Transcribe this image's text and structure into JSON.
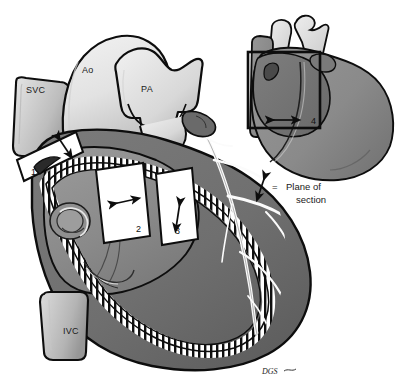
{
  "figure": {
    "background_color": "#ffffff",
    "outline_color": "#0d0d0d"
  },
  "palette": {
    "great_vessel_light": "#e8e8e8",
    "great_vessel_mid": "#c9c9c9",
    "vessel_shadow": "#9a9a9a",
    "myocardium": "#6f6f6f",
    "myocardium_dark": "#5a5a5a",
    "chamber_interior": "#8a8a8a",
    "chamber_interior_light": "#989898",
    "inset_body": "#8c8c8c",
    "inset_dark": "#6e6e6e",
    "trabecula_white": "#ffffff",
    "coronary_white": "#fbfbfb",
    "section_box_fill": "#ffffff",
    "line_black": "#0d0d0d"
  },
  "anatomy_labels": [
    {
      "id": "svc",
      "text": "SVC",
      "x": 26,
      "y": 93,
      "description": "superior vena cava"
    },
    {
      "id": "ao",
      "text": "Ao",
      "x": 82,
      "y": 73,
      "description": "aorta"
    },
    {
      "id": "pa",
      "text": "PA",
      "x": 141,
      "y": 92,
      "description": "pulmonary artery"
    },
    {
      "id": "ivc",
      "text": "IVC",
      "x": 63,
      "y": 334,
      "description": "inferior vena cava"
    }
  ],
  "section_boxes": [
    {
      "id": "box-1",
      "number": "1",
      "num_x": 31,
      "num_y": 175,
      "arrow": "diagonal",
      "has_crescent": true
    },
    {
      "id": "box-2",
      "number": "2",
      "num_x": 136,
      "num_y": 232,
      "arrow": "diagonal",
      "has_crescent": false
    },
    {
      "id": "box-3",
      "number": "3",
      "num_x": 175,
      "num_y": 234,
      "arrow": "vertical",
      "has_crescent": false
    },
    {
      "id": "box-4",
      "number": "4",
      "num_x": 311,
      "num_y": 124,
      "arrow": "horizontal",
      "has_crescent": false
    }
  ],
  "legend": {
    "symbol": "double-headed-arrow",
    "equals": "=",
    "line1": "Plane of",
    "line2": "section",
    "x": 310,
    "y": 186
  },
  "signature": {
    "text": "DGS",
    "x": 262,
    "y": 374
  },
  "inset": {
    "id": "whole-heart-inset",
    "description": "small whole-heart orientation drawing with section-plane box 4",
    "x": 238,
    "y": 14,
    "width": 160,
    "height": 165
  }
}
